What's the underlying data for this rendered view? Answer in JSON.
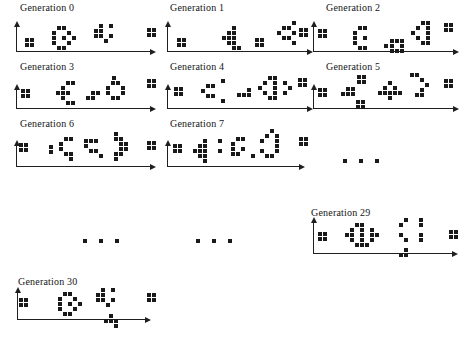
{
  "figure": {
    "width": 465,
    "height": 344,
    "colors": {
      "ink": "#1a1a1a",
      "axis": "#1f1f1f",
      "background": "#ffffff",
      "label": "#141414"
    },
    "ellipsis_marks": [
      {
        "name": "ellipsis-row3",
        "x": 343,
        "y": 159,
        "s": 4,
        "g": 4,
        "grid": [
          "#.#.#"
        ]
      },
      {
        "name": "ellipsis-row4-left",
        "x": 83,
        "y": 239,
        "s": 4,
        "g": 4,
        "grid": [
          "#.#.#"
        ]
      },
      {
        "name": "ellipsis-row4-mid",
        "x": 196,
        "y": 239,
        "s": 4,
        "g": 4,
        "grid": [
          "#.#.#"
        ]
      }
    ],
    "panels": [
      {
        "name": "generation-0",
        "label": "Generation 0",
        "label_pos": [
          20,
          2
        ],
        "axis": {
          "origin": [
            16,
            51
          ],
          "x_end": 156,
          "y_top": 21
        },
        "sprites": [
          {
            "name": "block-left",
            "x": 25,
            "y": 38,
            "grid": [
              "##",
              "##"
            ]
          },
          {
            "name": "ring-creature",
            "x": 52,
            "y": 26,
            "grid": [
              ".##..",
              "#..#.",
              "#.#.#",
              "#..#.",
              ".##.."
            ]
          },
          {
            "name": "k-creature",
            "x": 94,
            "y": 24,
            "grid": [
              ".#.#",
              "##..",
              "##.#",
              "..#."
            ]
          },
          {
            "name": "block-right",
            "x": 147,
            "y": 28,
            "grid": [
              "##",
              "##"
            ]
          }
        ]
      },
      {
        "name": "generation-1",
        "label": "Generation 1",
        "label_pos": [
          170,
          2
        ],
        "axis": {
          "origin": [
            167,
            51
          ],
          "x_end": 313,
          "y_top": 21
        },
        "sprites": [
          {
            "name": "block-left",
            "x": 177,
            "y": 38,
            "grid": [
              "##",
              "##"
            ]
          },
          {
            "name": "arrow-left-creature",
            "x": 222,
            "y": 26,
            "grid": [
              "..#.",
              ".##.",
              "###.",
              ".##.",
              "..##"
            ]
          },
          {
            "name": "block-mid",
            "x": 255,
            "y": 38,
            "grid": [
              "##",
              "##"
            ]
          },
          {
            "name": "diamond-creature",
            "x": 272,
            "y": 21,
            "grid": [
              "....#",
              "..##.",
              ".#..#",
              "..##.",
              "....#"
            ]
          },
          {
            "name": "block-right",
            "x": 299,
            "y": 28,
            "grid": [
              "##",
              "##"
            ]
          }
        ]
      },
      {
        "name": "generation-2",
        "label": "Generation 2",
        "label_pos": [
          326,
          2
        ],
        "axis": {
          "origin": [
            313,
            51
          ],
          "x_end": 459,
          "y_top": 21
        },
        "sprites": [
          {
            "name": "block-left",
            "x": 318,
            "y": 29,
            "grid": [
              "##",
              "##"
            ]
          },
          {
            "name": "c-creature",
            "x": 353,
            "y": 26,
            "grid": [
              ".##",
              "#..",
              "#.#",
              "#..",
              ".##"
            ]
          },
          {
            "name": "dash",
            "x": 384,
            "y": 44,
            "grid": [
              "#"
            ]
          },
          {
            "name": "o-creature",
            "x": 390,
            "y": 39,
            "grid": [
              "###",
              "#.#",
              "###"
            ]
          },
          {
            "name": "triangle-creature",
            "x": 411,
            "y": 21,
            "grid": [
              "..##",
              ".#.#",
              "#..#",
              ".#.#",
              "..##"
            ]
          },
          {
            "name": "block-right",
            "x": 444,
            "y": 23,
            "grid": [
              "##",
              "##"
            ]
          }
        ]
      },
      {
        "name": "generation-3",
        "label": "Generation 3",
        "label_pos": [
          20,
          61
        ],
        "axis": {
          "origin": [
            16,
            108
          ],
          "x_end": 156,
          "y_top": 84
        },
        "sprites": [
          {
            "name": "block-left",
            "x": 21,
            "y": 89,
            "grid": [
              "##",
              "##"
            ]
          },
          {
            "name": "arrow-left-creature",
            "x": 56,
            "y": 81,
            "grid": [
              "..##",
              ".#..",
              "###.",
              ".#..",
              "..##"
            ]
          },
          {
            "name": "a-blob",
            "x": 86,
            "y": 91,
            "grid": [
              ".##",
              "##."
            ]
          },
          {
            "name": "dot",
            "x": 112,
            "y": 76,
            "grid": [
              "#"
            ]
          },
          {
            "name": "ring-creature",
            "x": 106,
            "y": 81,
            "grid": [
              ".##.",
              "#..#",
              "#..#",
              ".##."
            ]
          },
          {
            "name": "block-right",
            "x": 147,
            "y": 79,
            "grid": [
              "##",
              "##"
            ]
          }
        ]
      },
      {
        "name": "generation-4",
        "label": "Generation 4",
        "label_pos": [
          170,
          61
        ],
        "axis": {
          "origin": [
            167,
            108
          ],
          "x_end": 313,
          "y_top": 84
        },
        "sprites": [
          {
            "name": "block-left",
            "x": 174,
            "y": 87,
            "grid": [
              "##",
              "##"
            ]
          },
          {
            "name": "bracket-creature",
            "x": 201,
            "y": 79,
            "grid": [
              "....#",
              ".##..",
              "#....",
              ".##..",
              "....#"
            ]
          },
          {
            "name": "j-blob",
            "x": 237,
            "y": 88,
            "grid": [
              "..#",
              "###"
            ]
          },
          {
            "name": "eye-creature",
            "x": 258,
            "y": 76,
            "grid": [
              "..##...",
              ".#.#.#.",
              "#..#..#",
              ".#.#.#.",
              "..##..."
            ]
          },
          {
            "name": "block-right",
            "x": 298,
            "y": 78,
            "grid": [
              "##",
              "##"
            ]
          }
        ]
      },
      {
        "name": "generation-5",
        "label": "Generation 5",
        "label_pos": [
          326,
          61
        ],
        "axis": {
          "origin": [
            313,
            108
          ],
          "x_end": 459,
          "y_top": 84
        },
        "sprites": [
          {
            "name": "block-left",
            "x": 318,
            "y": 88,
            "grid": [
              "##",
              "##"
            ]
          },
          {
            "name": "blob",
            "x": 341,
            "y": 87,
            "grid": [
              ".##",
              "###"
            ]
          },
          {
            "name": "dot-top",
            "x": 357,
            "y": 75,
            "grid": [
              "##",
              "##"
            ]
          },
          {
            "name": "dot-bottom",
            "x": 356,
            "y": 100,
            "grid": [
              "##",
              "##"
            ]
          },
          {
            "name": "four-creature",
            "x": 378,
            "y": 81,
            "grid": [
              "..#..",
              ".#.#.",
              "#####",
              "..#.."
            ]
          },
          {
            "name": "arc-creature",
            "x": 410,
            "y": 73,
            "grid": [
              "##..",
              "..#.",
              "...#",
              "..#.",
              ".##."
            ]
          },
          {
            "name": "block-right",
            "x": 444,
            "y": 79,
            "grid": [
              "##",
              "##"
            ]
          }
        ]
      },
      {
        "name": "generation-6",
        "label": "Generation 6",
        "label_pos": [
          20,
          118
        ],
        "axis": {
          "origin": [
            16,
            166
          ],
          "x_end": 156,
          "y_top": 140
        },
        "sprites": [
          {
            "name": "block-left",
            "x": 19,
            "y": 143,
            "grid": [
              "##",
              "##"
            ]
          },
          {
            "name": "dash-vertical",
            "x": 49,
            "y": 145,
            "grid": [
              "#",
              "#"
            ]
          },
          {
            "name": "e-creature",
            "x": 59,
            "y": 137,
            "grid": [
              ".##",
              "#..",
              "#..",
              ".##",
              "..#"
            ]
          },
          {
            "name": "t-creature",
            "x": 84,
            "y": 139,
            "grid": [
              "###.",
              "#...",
              ".##.",
              "...#"
            ]
          },
          {
            "name": "arrow-right-creature",
            "x": 114,
            "y": 132,
            "grid": [
              "#..",
              "##.",
              ".##",
              ".##",
              "##.",
              "#.."
            ]
          },
          {
            "name": "block-right",
            "x": 147,
            "y": 141,
            "grid": [
              "##",
              "##"
            ]
          }
        ]
      },
      {
        "name": "generation-7",
        "label": "Generation 7",
        "label_pos": [
          170,
          118
        ],
        "axis": {
          "origin": [
            167,
            166
          ],
          "x_end": 305,
          "y_top": 140
        },
        "sprites": [
          {
            "name": "block-left",
            "x": 173,
            "y": 144,
            "grid": [
              "##",
              "##"
            ]
          },
          {
            "name": "arrow-left-creature",
            "x": 193,
            "y": 139,
            "grid": [
              "..#",
              ".##",
              "###",
              ".##",
              "..#"
            ]
          },
          {
            "name": "colon",
            "x": 218,
            "y": 139,
            "grid": [
              "#",
              ".",
              "#"
            ]
          },
          {
            "name": "g-creature",
            "x": 231,
            "y": 137,
            "grid": [
              ".##",
              "#..",
              "#.#",
              "##."
            ]
          },
          {
            "name": "dot",
            "x": 251,
            "y": 154,
            "grid": [
              "#"
            ]
          },
          {
            "name": "d-creature",
            "x": 260,
            "y": 129,
            "grid": [
              "..#.",
              ".#.#",
              "#..#",
              "...#",
              "#..#",
              ".##."
            ]
          },
          {
            "name": "block-right",
            "x": 299,
            "y": 137,
            "grid": [
              "##",
              "##"
            ]
          }
        ]
      },
      {
        "name": "generation-29",
        "label": "Generation 29",
        "label_pos": [
          311,
          207
        ],
        "axis": {
          "origin": [
            313,
            253
          ],
          "x_end": 458,
          "y_top": 217
        },
        "sprites": [
          {
            "name": "block-left",
            "x": 318,
            "y": 232,
            "grid": [
              "##",
              "##"
            ]
          },
          {
            "name": "eye-creature",
            "x": 345,
            "y": 223,
            "grid": [
              "..##...",
              ".#.#.#.",
              "##.#.##",
              ".#.#.#.",
              "..###.."
            ]
          },
          {
            "name": "bracket-creature",
            "x": 399,
            "y": 218,
            "grid": [
              ".#..#",
              "#...#",
              ".....",
              "#...#",
              ".#..#"
            ]
          },
          {
            "name": "block-right",
            "x": 449,
            "y": 230,
            "grid": [
              "##",
              "##"
            ]
          },
          {
            "name": "tail-blob",
            "x": 399,
            "y": 248,
            "grid": [
              ".#",
              "##"
            ]
          }
        ]
      },
      {
        "name": "generation-30",
        "label": "Generation 30",
        "label_pos": [
          18,
          276
        ],
        "axis": {
          "origin": [
            17,
            319
          ],
          "x_end": 151,
          "y_top": 287
        },
        "sprites": [
          {
            "name": "block-left",
            "x": 19,
            "y": 298,
            "grid": [
              "##",
              "##"
            ]
          },
          {
            "name": "ring-creature",
            "x": 58,
            "y": 292,
            "grid": [
              ".##..",
              "#..#.",
              "#.#.#",
              "#..#.",
              ".##.."
            ]
          },
          {
            "name": "k-creature",
            "x": 96,
            "y": 288,
            "grid": [
              ".#.#",
              "##..",
              "##.#",
              "..#."
            ]
          },
          {
            "name": "block-right",
            "x": 147,
            "y": 293,
            "grid": [
              "##",
              "##"
            ]
          },
          {
            "name": "tail-blob",
            "x": 104,
            "y": 314,
            "grid": [
              ".#.",
              "###",
              "..#"
            ]
          }
        ]
      }
    ]
  }
}
